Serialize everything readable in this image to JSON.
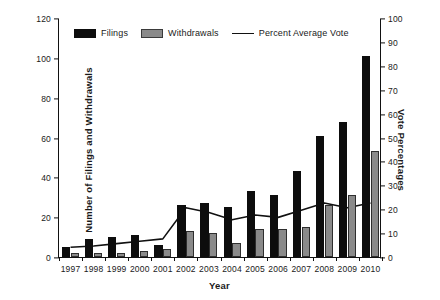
{
  "chart_data": {
    "type": "bar",
    "title": "",
    "xlabel": "Year",
    "ylabel": "Number of Filings and Withdrawals",
    "ylabel_right": "Vote Percentages",
    "categories": [
      "1997",
      "1998",
      "1999",
      "2000",
      "2001",
      "2002",
      "2003",
      "2004",
      "2005",
      "2006",
      "2007",
      "2008",
      "2009",
      "2010"
    ],
    "ylim": [
      0,
      120
    ],
    "ylim_right": [
      0,
      100
    ],
    "yticks": [
      0,
      20,
      40,
      60,
      80,
      100,
      120
    ],
    "yticks_right": [
      0,
      10,
      20,
      30,
      40,
      50,
      60,
      70,
      80,
      90,
      100
    ],
    "grid": false,
    "legend_position": "top-inside",
    "series": [
      {
        "name": "Filings",
        "type": "bar",
        "axis": "left",
        "color": "#0d0d0d",
        "values": [
          5,
          9,
          10,
          11,
          6,
          26,
          27,
          25,
          33,
          31,
          43,
          61,
          68,
          101
        ]
      },
      {
        "name": "Withdrawals",
        "type": "bar",
        "axis": "left",
        "color": "#8a8a8a",
        "values": [
          2,
          2,
          2,
          3,
          4,
          13,
          12,
          7,
          14,
          14,
          15,
          26,
          31,
          53
        ]
      },
      {
        "name": "Percent Average Vote",
        "type": "line",
        "axis": "right",
        "color": "#111111",
        "values": [
          4.5,
          5,
          6,
          7,
          8,
          21,
          19,
          16,
          18,
          17,
          20,
          23,
          21,
          23
        ]
      }
    ]
  },
  "legend": {
    "items": [
      {
        "label": "Filings",
        "swatch": "filings"
      },
      {
        "label": "Withdrawals",
        "swatch": "withdrawals"
      },
      {
        "label": "Percent Average Vote",
        "swatch": "line"
      }
    ]
  }
}
